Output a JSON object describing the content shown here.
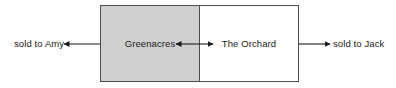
{
  "diagram": {
    "background_color": "#ffffff",
    "border_color": "#4d4d4d",
    "text_color": "#1a1a1a",
    "parcels": [
      {
        "id": "greenacres",
        "label": "Greenacres",
        "fill_color": "#cfcfcf"
      },
      {
        "id": "the-orchard",
        "label": "The Orchard",
        "fill_color": "#ffffff"
      }
    ],
    "annotations": [
      {
        "id": "sold-to-amy",
        "label": "sold to Amy",
        "side": "left",
        "arrow_direction": "left"
      },
      {
        "id": "sold-to-jack",
        "label": "sold to Jack",
        "side": "right",
        "arrow_direction": "right"
      }
    ],
    "center_arrows": [
      {
        "id": "center-arrow-left",
        "arrow_direction": "left"
      },
      {
        "id": "center-arrow-right",
        "arrow_direction": "right"
      }
    ]
  }
}
